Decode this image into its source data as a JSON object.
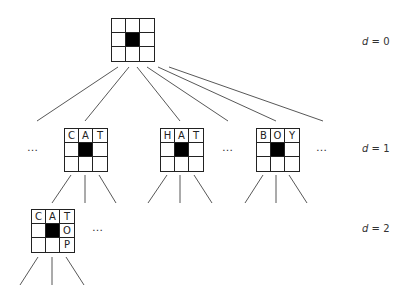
{
  "diagram": {
    "type": "search-tree",
    "depth_labels": [
      {
        "variable": "d",
        "operator": "=",
        "value": "0"
      },
      {
        "variable": "d",
        "operator": "=",
        "value": "1"
      },
      {
        "variable": "d",
        "operator": "=",
        "value": "2"
      }
    ],
    "ellipsis": "…",
    "nodes": {
      "root": {
        "depth": 0,
        "cells": [
          "",
          "",
          "",
          "",
          "■",
          "",
          "",
          "",
          ""
        ]
      },
      "cat": {
        "depth": 1,
        "cells": [
          "C",
          "A",
          "T",
          "",
          "■",
          "",
          "",
          "",
          ""
        ]
      },
      "hat": {
        "depth": 1,
        "cells": [
          "H",
          "A",
          "T",
          "",
          "■",
          "",
          "",
          "",
          ""
        ]
      },
      "boy": {
        "depth": 1,
        "cells": [
          "B",
          "O",
          "Y",
          "",
          "■",
          "",
          "",
          "",
          ""
        ]
      },
      "catop": {
        "depth": 2,
        "cells": [
          "C",
          "A",
          "T",
          "",
          "■",
          "O",
          "",
          "",
          "P"
        ]
      }
    },
    "colors": {
      "line": "#444444",
      "grid": "#222222",
      "blocked_cell": "#000000",
      "background": "#ffffff"
    }
  }
}
